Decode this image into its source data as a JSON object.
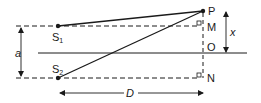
{
  "diagram": {
    "type": "double-slit geometry",
    "labels": {
      "P": "P",
      "M": "M",
      "O": "O",
      "N": "N",
      "S1_main": "S",
      "S1_sub": "1",
      "S2_main": "S",
      "S2_sub": "2",
      "a": "a",
      "x": "x",
      "D": "D"
    },
    "colors": {
      "stroke": "#1a1a1a",
      "background": "#ffffff"
    }
  }
}
